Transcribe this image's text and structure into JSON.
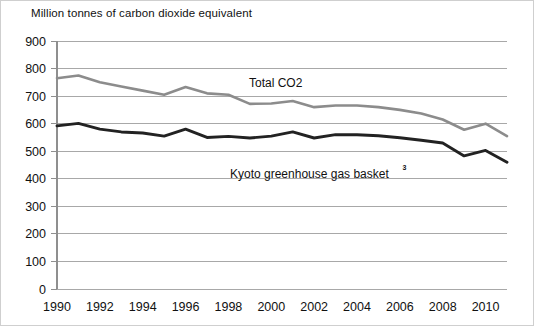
{
  "axis_title": "Million tonnes of carbon dioxide equivalent",
  "annotations": [
    {
      "name": "total-co2-label",
      "text": "Total CO2",
      "sup": "",
      "x": 248,
      "y": 86
    },
    {
      "name": "kyoto-basket-label",
      "text": "Kyoto greenhouse gas basket",
      "sup": "3",
      "x": 229,
      "y": 177
    }
  ],
  "colors": {
    "total_co2": "#8c8c8c",
    "kyoto_basket": "#222222",
    "gridline": "#a8a8a8",
    "axis": "#8f8f8f",
    "background": "#ffffff",
    "text": "#111111"
  },
  "chart_data": {
    "type": "line",
    "title": "",
    "subtitle": "",
    "xlabel": "",
    "ylabel": "Million tonnes of carbon dioxide equivalent",
    "ylim": [
      0,
      900
    ],
    "ytick_step": 100,
    "ytick_labels": [
      "900",
      "800",
      "700",
      "600",
      "500",
      "400",
      "300",
      "200",
      "100",
      "0"
    ],
    "xlim": [
      1990,
      2011
    ],
    "xtick_labels": [
      "1990",
      "1992",
      "1994",
      "1996",
      "1998",
      "2000",
      "2002",
      "2004",
      "2006",
      "2008",
      "2010"
    ],
    "xticks": [
      1990,
      1992,
      1994,
      1996,
      1998,
      2000,
      2002,
      2004,
      2006,
      2008,
      2010
    ],
    "grid": true,
    "legend": "inline-annotations",
    "x": [
      1990,
      1991,
      1992,
      1993,
      1994,
      1995,
      1996,
      1997,
      1998,
      1999,
      2000,
      2001,
      2002,
      2003,
      2004,
      2005,
      2006,
      2007,
      2008,
      2009,
      2010,
      2011
    ],
    "series": [
      {
        "name": "Total CO2",
        "color": "#8c8c8c",
        "values": [
          765,
          775,
          750,
          735,
          720,
          705,
          733,
          710,
          705,
          672,
          673,
          682,
          660,
          666,
          666,
          660,
          650,
          637,
          615,
          578,
          600,
          555
        ]
      },
      {
        "name": "Kyoto greenhouse gas basket",
        "color": "#222222",
        "values": [
          592,
          601,
          580,
          570,
          566,
          555,
          580,
          550,
          554,
          548,
          555,
          570,
          548,
          560,
          560,
          556,
          549,
          540,
          530,
          483,
          503,
          460
        ]
      }
    ]
  }
}
